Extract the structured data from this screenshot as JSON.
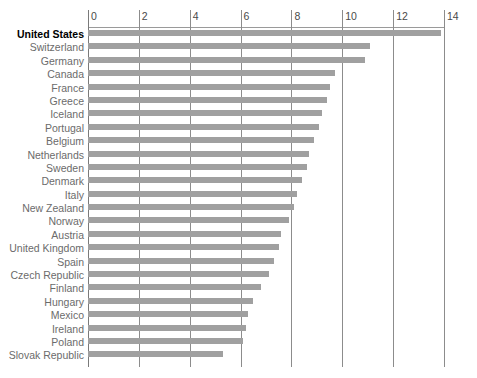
{
  "chart_data": {
    "type": "bar",
    "orientation": "horizontal",
    "title": "",
    "subtitle": "",
    "xlabel": "",
    "ylabel": "",
    "xlim": [
      0,
      14
    ],
    "ticks": [
      0,
      2,
      4,
      6,
      8,
      10,
      12,
      14
    ],
    "tick_labels": [
      "0",
      "2",
      "4",
      "6",
      "8",
      "10",
      "12",
      "14"
    ],
    "grid": "vertical",
    "legend": "none",
    "bar_color": "#a0a0a0",
    "highlight_label_color": "#000000",
    "label_color": "#6b6b6b",
    "highlighted_category": "United States",
    "categories": [
      "United States",
      "Switzerland",
      "Germany",
      "Canada",
      "France",
      "Greece",
      "Iceland",
      "Portugal",
      "Belgium",
      "Netherlands",
      "Sweden",
      "Denmark",
      "Italy",
      "New Zealand",
      "Norway",
      "Austria",
      "United Kingdom",
      "Spain",
      "Czech Republic",
      "Finland",
      "Hungary",
      "Mexico",
      "Ireland",
      "Poland",
      "Slovak Republic"
    ],
    "values": [
      13.9,
      11.1,
      10.9,
      9.7,
      9.5,
      9.4,
      9.2,
      9.1,
      8.9,
      8.7,
      8.6,
      8.4,
      8.2,
      8.1,
      7.9,
      7.6,
      7.5,
      7.3,
      7.1,
      6.8,
      6.5,
      6.3,
      6.2,
      6.1,
      5.3
    ]
  }
}
